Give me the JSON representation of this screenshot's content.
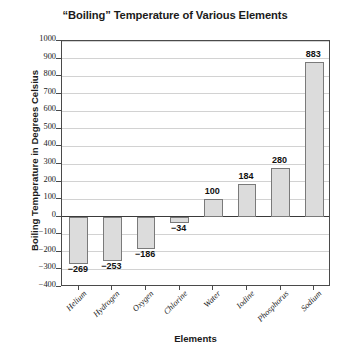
{
  "chart_data": {
    "type": "bar",
    "title": "“Boiling” Temperature of Various Elements",
    "xlabel": "Elements",
    "ylabel": "Boiling Temperature in Degrees Celsius",
    "categories": [
      "Helium",
      "Hydrogen",
      "Oxygen",
      "Chlorine",
      "Water",
      "Iodine",
      "Phosphorus",
      "Sodium"
    ],
    "values": [
      -269,
      -253,
      -186,
      -34,
      100,
      184,
      280,
      883
    ],
    "value_labels": [
      "−269",
      "−253",
      "−186",
      "−34",
      "100",
      "184",
      "280",
      "883"
    ],
    "ylim": [
      -400,
      1000
    ],
    "ytick_step": 100,
    "yticks": [
      1000,
      900,
      800,
      700,
      600,
      500,
      400,
      300,
      200,
      100,
      0,
      -100,
      -200,
      -300,
      -400
    ],
    "ytick_labels": [
      "1000",
      "900",
      "800",
      "700",
      "600",
      "500",
      "400",
      "300",
      "200",
      "100",
      "0",
      "−100",
      "−200",
      "−300",
      "−400"
    ],
    "grid": true,
    "legend": false,
    "bar_color": "#dcdcdc",
    "bar_border_color": "#7a7a7a",
    "gridline_color": "#d2d2d2",
    "axis_color": "#4a4a4a",
    "text_color": "#1b1b1b",
    "background_color": "#ffffff"
  }
}
